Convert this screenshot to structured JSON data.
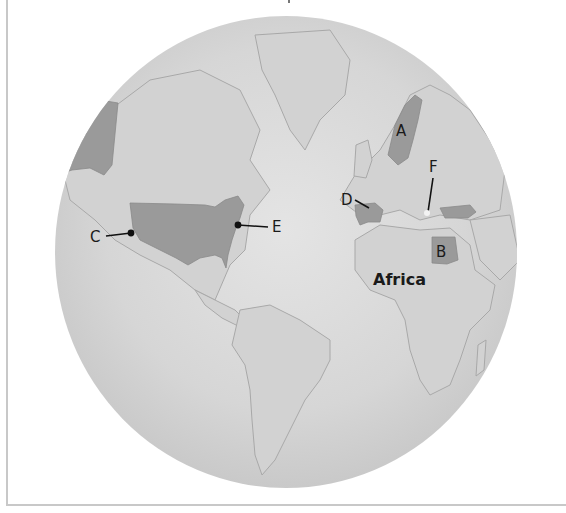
{
  "map": {
    "type": "globe-projection",
    "colors": {
      "ocean": "#d9d9d9",
      "land": "#cfcfcf",
      "coast": "#9a9a9a",
      "highlight": "#9a9a9a",
      "label": "#1a1a1a",
      "frame": "#c8c8c8"
    },
    "continent_label": "Africa",
    "markers": [
      {
        "id": "A",
        "label": "A",
        "region": "Scandinavia (Sweden)"
      },
      {
        "id": "B",
        "label": "B",
        "region": "Egypt"
      },
      {
        "id": "C",
        "label": "C",
        "region": "United States west coast"
      },
      {
        "id": "D",
        "label": "D",
        "region": "Spain"
      },
      {
        "id": "E",
        "label": "E",
        "region": "United States east coast"
      },
      {
        "id": "F",
        "label": "F",
        "region": "Greece"
      }
    ],
    "highlighted_regions": [
      "United States",
      "Alaska",
      "Sweden",
      "Spain",
      "Egypt",
      "Turkey"
    ]
  }
}
